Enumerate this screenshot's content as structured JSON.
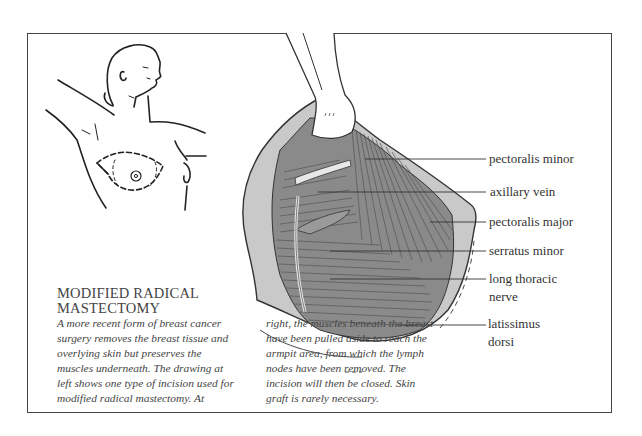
{
  "title": {
    "line1": "MODIFIED RADICAL",
    "line2": "MASTECTOMY"
  },
  "caption": {
    "left_lines": [
      "A more recent form of breast cancer",
      "surgery removes the breast tissue and",
      "overlying skin but preserves the",
      "muscles underneath. The drawing at",
      "left shows one type of incision used for",
      "modified radical mastectomy. At"
    ],
    "right_lines": [
      "right, the muscles beneath the breast",
      "have been pulled aside to reach the",
      "armpit area, from which the lymph",
      "nodes have been removed. The",
      "incision will then be closed. Skin",
      "graft is rarely necessary."
    ]
  },
  "labels": [
    {
      "line1": "pectoralis minor"
    },
    {
      "line1": "axillary vein"
    },
    {
      "line1": "pectoralis major"
    },
    {
      "line1": "serratus minor"
    },
    {
      "line1": "long thoracic",
      "line2": "nerve"
    },
    {
      "line1": "latissimus",
      "line2": "dorsi"
    }
  ],
  "figures": {
    "left": "torso-incision-outline",
    "right": "surgical-field-muscles"
  }
}
